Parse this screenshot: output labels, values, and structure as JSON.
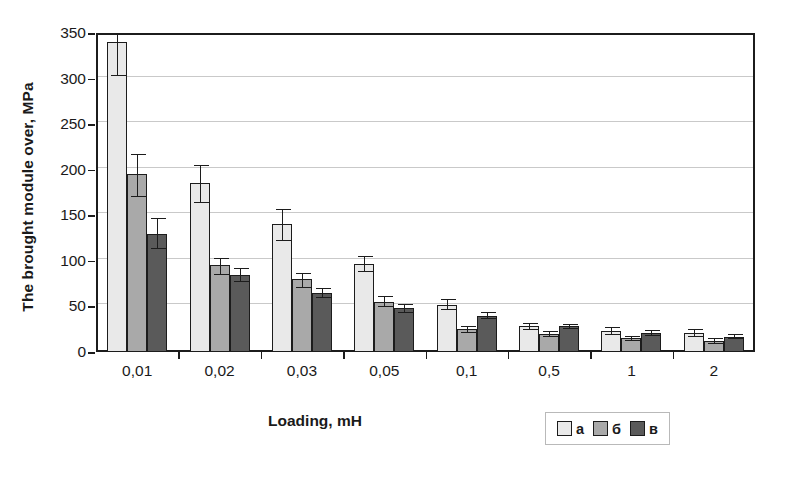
{
  "chart_data": {
    "type": "bar",
    "title": "",
    "xlabel": "Loading, mH",
    "ylabel": "The brought module over, MPa",
    "categories": [
      "0,01",
      "0,02",
      "0,03",
      "0,05",
      "0,1",
      "0,5",
      "1",
      "2"
    ],
    "ylim": [
      0,
      350
    ],
    "yticks": [
      0,
      50,
      100,
      150,
      200,
      250,
      300,
      350
    ],
    "ytick_labels": [
      "0",
      "50",
      "100",
      "150",
      "200",
      "250",
      "300",
      "350"
    ],
    "grid": true,
    "legend_position": "bottom-right",
    "series": [
      {
        "name": "а",
        "color": "#e9e9e9",
        "values": [
          340,
          185,
          140,
          97,
          52,
          28,
          23,
          21
        ],
        "err_low": [
          37,
          22,
          18,
          9,
          6,
          4,
          4,
          4
        ],
        "err_high": [
          10,
          20,
          17,
          8,
          6,
          4,
          4,
          4
        ]
      },
      {
        "name": "б",
        "color": "#a9a9a9",
        "values": [
          195,
          95,
          80,
          55,
          25,
          20,
          15,
          12
        ],
        "err_low": [
          25,
          10,
          10,
          6,
          4,
          3,
          3,
          3
        ],
        "err_high": [
          22,
          8,
          7,
          6,
          4,
          3,
          3,
          3
        ]
      },
      {
        "name": "в",
        "color": "#5a5a5a",
        "values": [
          130,
          85,
          65,
          48,
          40,
          28,
          21,
          17
        ],
        "err_low": [
          17,
          8,
          6,
          5,
          4,
          3,
          3,
          3
        ],
        "err_high": [
          17,
          7,
          5,
          5,
          4,
          3,
          3,
          3
        ]
      }
    ]
  },
  "legend": {
    "items": [
      {
        "label": "а",
        "color": "#e9e9e9"
      },
      {
        "label": "б",
        "color": "#a9a9a9"
      },
      {
        "label": "в",
        "color": "#5a5a5a"
      }
    ]
  },
  "colors": {
    "series_a": "#e9e9e9",
    "series_b": "#a9a9a9",
    "series_v": "#5a5a5a",
    "axis": "#1c1c1c",
    "grid": "#c9c9c9",
    "background": "#ffffff"
  }
}
